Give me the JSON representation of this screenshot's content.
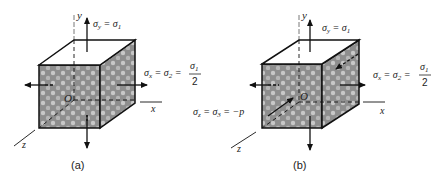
{
  "figures": [
    {
      "id": "a",
      "caption": "(a)",
      "axes": {
        "x": "x",
        "y": "y",
        "z": "z",
        "origin": "O"
      },
      "stresses": {
        "sigma_y": "σ",
        "sigma_y_sub": "y",
        "sigma_y_eq": " = σ",
        "sigma_y_eq_sub": "1",
        "sigma_x": "σ",
        "sigma_x_sub": "x",
        "sigma_x_mid": " = σ",
        "sigma_x_mid_sub": "2",
        "sigma_x_eq": " =",
        "frac_num": "σ",
        "frac_num_sub": "1",
        "frac_den": "2"
      }
    },
    {
      "id": "b",
      "caption": "(b)",
      "axes": {
        "x": "x",
        "y": "y",
        "z": "z",
        "origin": "O"
      },
      "stresses": {
        "sigma_y": "σ",
        "sigma_y_sub": "y",
        "sigma_y_eq": " = σ",
        "sigma_y_eq_sub": "1",
        "sigma_x": "σ",
        "sigma_x_sub": "x",
        "sigma_x_mid": " = σ",
        "sigma_x_mid_sub": "2",
        "sigma_x_eq": " =",
        "frac_num": "σ",
        "frac_num_sub": "1",
        "frac_den": "2",
        "sigma_z": "σ",
        "sigma_z_sub": "z",
        "sigma_z_mid": " = σ",
        "sigma_z_mid_sub": "3",
        "sigma_z_eq": " = −p"
      }
    }
  ],
  "colors": {
    "face_fill": "#9a9a9a",
    "stroke": "#111111"
  }
}
